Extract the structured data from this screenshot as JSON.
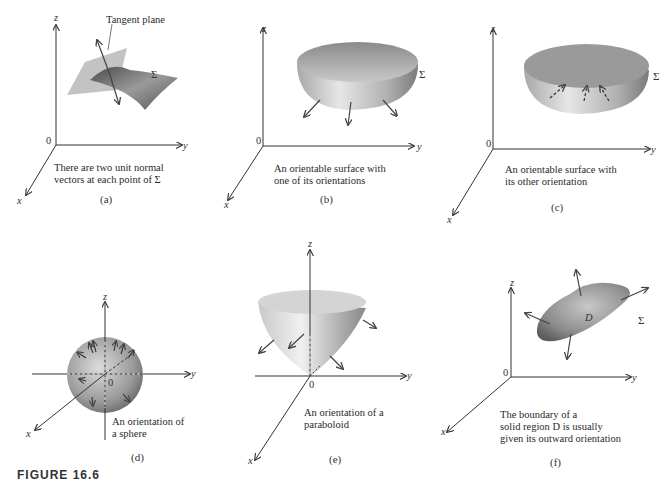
{
  "figure_caption": "FIGURE 16.6",
  "panels": [
    {
      "id": "a",
      "sublabel": "(a)",
      "caption_lines": [
        "There are two unit normal",
        "vectors at each point of Σ"
      ],
      "annotation": "Tangent plane",
      "surface_label": "Σ",
      "axes": {
        "x": "x",
        "y": "y",
        "z": "z",
        "origin": "0"
      }
    },
    {
      "id": "b",
      "sublabel": "(b)",
      "caption_lines": [
        "An orientable surface with",
        "one of its orientations"
      ],
      "surface_label": "Σ",
      "axes": {
        "x": "x",
        "y": "y",
        "z": "z",
        "origin": "0"
      }
    },
    {
      "id": "c",
      "sublabel": "(c)",
      "caption_lines": [
        "An orientable surface with",
        "its other orientation"
      ],
      "surface_label": "Σ",
      "axes": {
        "x": "x",
        "y": "y",
        "z": "z",
        "origin": "0"
      }
    },
    {
      "id": "d",
      "sublabel": "(d)",
      "caption_lines": [
        "An orientation of",
        "a sphere"
      ],
      "axes": {
        "x": "x",
        "y": "y",
        "z": "z",
        "origin": "0"
      }
    },
    {
      "id": "e",
      "sublabel": "(e)",
      "caption_lines": [
        "An orientation of a",
        "paraboloid"
      ],
      "axes": {
        "x": "x",
        "y": "y",
        "z": "z",
        "origin": "0"
      }
    },
    {
      "id": "f",
      "sublabel": "(f)",
      "caption_lines": [
        "The boundary of a",
        "solid region D is usually",
        "given its outward orientation"
      ],
      "region_label": "D",
      "surface_label": "Σ",
      "axes": {
        "x": "x",
        "y": "y",
        "z": "z",
        "origin": "0"
      }
    }
  ],
  "colors": {
    "axis": "#333333",
    "surface_light": "#e0e0e0",
    "surface_dark": "#6a6a6a",
    "plane": "#b5b5b5"
  }
}
